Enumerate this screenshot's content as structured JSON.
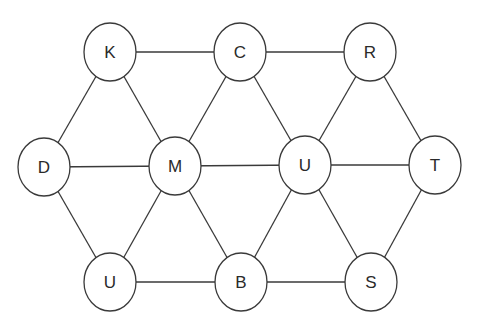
{
  "diagram": {
    "type": "graph",
    "colors": {
      "stroke": "#3a3a3a",
      "fill": "#ffffff",
      "text": "#2a2a2a"
    },
    "nodes": [
      {
        "id": "K",
        "label": "K",
        "x": 110,
        "y": 52
      },
      {
        "id": "C",
        "label": "C",
        "x": 240,
        "y": 52
      },
      {
        "id": "R",
        "label": "R",
        "x": 370,
        "y": 52
      },
      {
        "id": "D",
        "label": "D",
        "x": 44,
        "y": 167
      },
      {
        "id": "M",
        "label": "M",
        "x": 175,
        "y": 166
      },
      {
        "id": "U1",
        "label": "U",
        "x": 305,
        "y": 165
      },
      {
        "id": "T",
        "label": "T",
        "x": 435,
        "y": 165
      },
      {
        "id": "U2",
        "label": "U",
        "x": 110,
        "y": 282
      },
      {
        "id": "B",
        "label": "B",
        "x": 241,
        "y": 282
      },
      {
        "id": "S",
        "label": "S",
        "x": 371,
        "y": 282
      }
    ],
    "edges": [
      [
        "K",
        "C"
      ],
      [
        "C",
        "R"
      ],
      [
        "K",
        "D"
      ],
      [
        "K",
        "M"
      ],
      [
        "C",
        "M"
      ],
      [
        "C",
        "U1"
      ],
      [
        "R",
        "U1"
      ],
      [
        "R",
        "T"
      ],
      [
        "D",
        "M"
      ],
      [
        "M",
        "U1"
      ],
      [
        "U1",
        "T"
      ],
      [
        "D",
        "U2"
      ],
      [
        "M",
        "U2"
      ],
      [
        "M",
        "B"
      ],
      [
        "U1",
        "B"
      ],
      [
        "U1",
        "S"
      ],
      [
        "T",
        "S"
      ],
      [
        "U2",
        "B"
      ],
      [
        "B",
        "S"
      ]
    ]
  }
}
